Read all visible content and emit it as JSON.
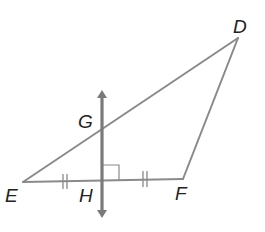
{
  "diagram": {
    "type": "geometry",
    "points": {
      "D": {
        "label": "D",
        "x": 238,
        "y": 38,
        "lx": 233,
        "ly": 33
      },
      "E": {
        "label": "E",
        "x": 23,
        "y": 182,
        "lx": 5,
        "ly": 202
      },
      "F": {
        "label": "F",
        "x": 183,
        "y": 179,
        "lx": 175,
        "ly": 200
      },
      "G": {
        "label": "G",
        "x": 101,
        "y": 128,
        "lx": 79,
        "ly": 128
      },
      "H": {
        "label": "H",
        "x": 102,
        "y": 181,
        "lx": 79,
        "ly": 202
      }
    },
    "segments": [
      "DE",
      "EF",
      "FD"
    ],
    "perpendicular_line": {
      "through": [
        "G",
        "H"
      ],
      "arrows": "both",
      "color": "#7a7a7a"
    },
    "marks": {
      "right_angle_at": "H",
      "congruent_ticks": [
        "EH",
        "HF"
      ],
      "tick_count": 2
    },
    "colors": {
      "line": "#8a8a8a",
      "perp": "#7a7a7a",
      "label": "#222222"
    }
  }
}
